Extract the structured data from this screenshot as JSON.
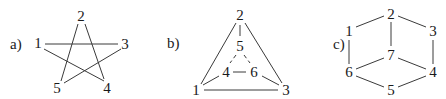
{
  "diagrams": [
    {
      "id": "a",
      "label": "a)",
      "label_pos": [
        10,
        49
      ],
      "nodes": [
        {
          "id": "1",
          "label": "1",
          "x": 38,
          "y": 43
        },
        {
          "id": "2",
          "label": "2",
          "x": 81,
          "y": 16
        },
        {
          "id": "3",
          "label": "3",
          "x": 125,
          "y": 44
        },
        {
          "id": "4",
          "label": "4",
          "x": 107,
          "y": 88
        },
        {
          "id": "5",
          "label": "5",
          "x": 57,
          "y": 88
        }
      ],
      "edges": [
        {
          "from": "1",
          "to": "3",
          "x1": 45,
          "y1": 44,
          "x2": 118,
          "y2": 44
        },
        {
          "from": "1",
          "to": "4",
          "x1": 44,
          "y1": 49,
          "x2": 104,
          "y2": 81
        },
        {
          "from": "2",
          "to": "5",
          "x1": 78,
          "y1": 24,
          "x2": 61,
          "y2": 81
        },
        {
          "from": "2",
          "to": "4",
          "x1": 85,
          "y1": 24,
          "x2": 104,
          "y2": 79
        },
        {
          "from": "3",
          "to": "5",
          "x1": 121,
          "y1": 49,
          "x2": 64,
          "y2": 83
        }
      ]
    },
    {
      "id": "b",
      "label": "b)",
      "label_pos": [
        167,
        48
      ],
      "nodes": [
        {
          "id": "2",
          "label": "2",
          "x": 240,
          "y": 15
        },
        {
          "id": "5",
          "label": "5",
          "x": 240,
          "y": 46
        },
        {
          "id": "4",
          "label": "4",
          "x": 226,
          "y": 72
        },
        {
          "id": "6",
          "label": "6",
          "x": 254,
          "y": 72
        },
        {
          "id": "1",
          "label": "1",
          "x": 196,
          "y": 90
        },
        {
          "id": "3",
          "label": "3",
          "x": 286,
          "y": 90
        }
      ],
      "edges": [
        {
          "from": "2",
          "to": "1",
          "x1": 236,
          "y1": 23,
          "x2": 201,
          "y2": 84,
          "style": "solid"
        },
        {
          "from": "2",
          "to": "3",
          "x1": 245,
          "y1": 23,
          "x2": 282,
          "y2": 83,
          "style": "solid"
        },
        {
          "from": "2",
          "to": "5",
          "x1": 240,
          "y1": 25,
          "x2": 240,
          "y2": 36,
          "style": "solid"
        },
        {
          "from": "1",
          "to": "3",
          "x1": 204,
          "y1": 90,
          "x2": 278,
          "y2": 90,
          "style": "solid"
        },
        {
          "from": "1",
          "to": "4",
          "x1": 203,
          "y1": 85,
          "x2": 219,
          "y2": 76,
          "style": "solid"
        },
        {
          "from": "3",
          "to": "6",
          "x1": 279,
          "y1": 85,
          "x2": 262,
          "y2": 76,
          "style": "solid"
        },
        {
          "from": "4",
          "to": "6",
          "x1": 233,
          "y1": 72,
          "x2": 246,
          "y2": 72,
          "style": "solid"
        },
        {
          "from": "5",
          "to": "4",
          "x1": 236,
          "y1": 55,
          "x2": 230,
          "y2": 63,
          "style": "dashed"
        },
        {
          "from": "5",
          "to": "6",
          "x1": 244,
          "y1": 55,
          "x2": 250,
          "y2": 63,
          "style": "dashed"
        }
      ]
    },
    {
      "id": "c",
      "label": "c)",
      "label_pos": [
        333,
        49
      ],
      "nodes": [
        {
          "id": "2",
          "label": "2",
          "x": 391,
          "y": 14
        },
        {
          "id": "1",
          "label": "1",
          "x": 349,
          "y": 31
        },
        {
          "id": "3",
          "label": "3",
          "x": 433,
          "y": 31
        },
        {
          "id": "7",
          "label": "7",
          "x": 391,
          "y": 55
        },
        {
          "id": "6",
          "label": "6",
          "x": 349,
          "y": 72
        },
        {
          "id": "4",
          "label": "4",
          "x": 433,
          "y": 72
        },
        {
          "id": "5",
          "label": "5",
          "x": 391,
          "y": 90
        }
      ],
      "edges": [
        {
          "from": "1",
          "to": "2",
          "x1": 356,
          "y1": 27,
          "x2": 384,
          "y2": 16
        },
        {
          "from": "2",
          "to": "3",
          "x1": 398,
          "y1": 16,
          "x2": 426,
          "y2": 27
        },
        {
          "from": "2",
          "to": "7",
          "x1": 391,
          "y1": 22,
          "x2": 391,
          "y2": 46
        },
        {
          "from": "1",
          "to": "6",
          "x1": 349,
          "y1": 40,
          "x2": 349,
          "y2": 64
        },
        {
          "from": "3",
          "to": "4",
          "x1": 433,
          "y1": 40,
          "x2": 433,
          "y2": 64
        },
        {
          "from": "7",
          "to": "6",
          "x1": 384,
          "y1": 58,
          "x2": 356,
          "y2": 69
        },
        {
          "from": "7",
          "to": "4",
          "x1": 398,
          "y1": 58,
          "x2": 426,
          "y2": 69
        },
        {
          "from": "6",
          "to": "5",
          "x1": 356,
          "y1": 76,
          "x2": 384,
          "y2": 87
        },
        {
          "from": "5",
          "to": "4",
          "x1": 398,
          "y1": 87,
          "x2": 426,
          "y2": 76
        }
      ]
    }
  ]
}
